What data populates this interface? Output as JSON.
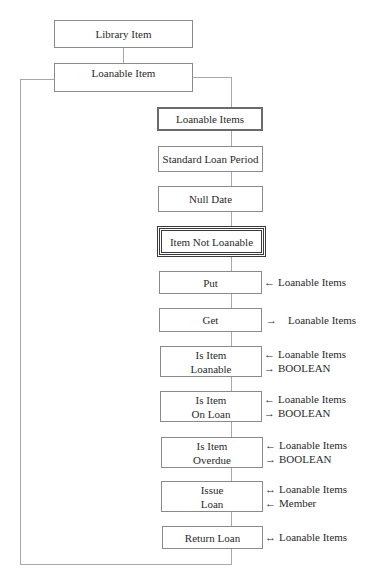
{
  "diagram": {
    "root": {
      "label": "Library Item"
    },
    "parent": {
      "label": "Loanable Item"
    },
    "attributes": [
      {
        "label": "Loanable Items",
        "style": "thick"
      },
      {
        "label": "Standard Loan Period",
        "style": "normal"
      },
      {
        "label": "Null Date",
        "style": "normal"
      },
      {
        "label": "Item Not Loanable",
        "style": "double"
      }
    ],
    "operations": [
      {
        "lines": [
          "Put"
        ],
        "interface": [
          {
            "arrow": "←",
            "label": "Loanable Items"
          }
        ]
      },
      {
        "lines": [
          "Get"
        ],
        "interface": [
          {
            "arrow": "→",
            "label": "Loanable Items"
          }
        ]
      },
      {
        "lines": [
          "Is Item",
          "Loanable"
        ],
        "interface": [
          {
            "arrow": "←",
            "label": "Loanable Items"
          },
          {
            "arrow": "→",
            "label": "BOOLEAN"
          }
        ]
      },
      {
        "lines": [
          "Is Item",
          "On Loan"
        ],
        "interface": [
          {
            "arrow": "←",
            "label": "Loanable Items"
          },
          {
            "arrow": "→",
            "label": "BOOLEAN"
          }
        ]
      },
      {
        "lines": [
          "Is Item",
          "Overdue"
        ],
        "interface": [
          {
            "arrow": "←",
            "label": "Loanable Items"
          },
          {
            "arrow": "→",
            "label": "BOOLEAN"
          }
        ]
      },
      {
        "lines": [
          "Issue",
          "Loan"
        ],
        "interface": [
          {
            "arrow": "↔",
            "label": "Loanable Items"
          },
          {
            "arrow": "←",
            "label": "Member"
          }
        ]
      },
      {
        "lines": [
          "Return Loan"
        ],
        "interface": [
          {
            "arrow": "↔",
            "label": "Loanable Items"
          }
        ]
      }
    ]
  }
}
